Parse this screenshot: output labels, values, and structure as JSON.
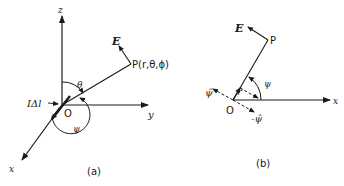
{
  "panel_a": {
    "caption": "(a)",
    "axis_z": "z",
    "axis_y": "y",
    "axis_x": "x",
    "origin": "O",
    "point": "P(r,θ,ϕ)",
    "field": "E",
    "current_element": "IΔl",
    "angle_theta": "θ",
    "angle_psi": "ψ"
  },
  "panel_b": {
    "caption": "(b)",
    "axis_x": "x",
    "origin": "O",
    "point": "P",
    "field": "E",
    "unit_r": "r̂",
    "unit_psi": "ψ̂",
    "unit_neg_psi": "-ψ̂",
    "angle_psi": "ψ"
  },
  "colors": {
    "ink": "#1a1a1a",
    "background": "#ffffff"
  }
}
